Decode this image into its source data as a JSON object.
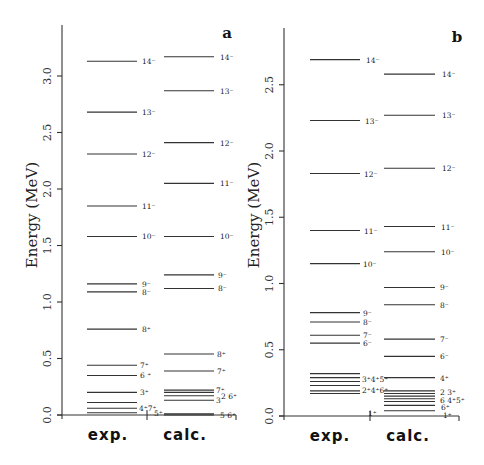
{
  "figure": {
    "panels": [
      {
        "id": "a",
        "letter": "a",
        "ylabel": "Energy (MeV)",
        "columns": [
          "exp.",
          "calc."
        ],
        "yaxis": {
          "zero_px": 415,
          "px_per_mev": 113,
          "x_px": 62,
          "top_px": 25,
          "ticks": [
            "0.0",
            "0.5",
            "1.0",
            "1.5",
            "2.0",
            "2.5",
            "3.0"
          ],
          "tick_values": [
            0.0,
            0.5,
            1.0,
            1.5,
            2.0,
            2.5,
            3.0
          ]
        },
        "baseline": {
          "x1": 57,
          "x2": 236,
          "sep_x": 147
        },
        "column_label_x": [
          108,
          185
        ],
        "exp": {
          "x1": 87,
          "x2": 137,
          "levels": [
            {
              "E": 3.13,
              "label": "14⁻",
              "lx": 142
            },
            {
              "E": 2.68,
              "label": "13⁻",
              "lx": 142
            },
            {
              "E": 2.31,
              "label": "12⁻",
              "lx": 142
            },
            {
              "E": 1.85,
              "label": "11⁻",
              "lx": 142
            },
            {
              "E": 1.58,
              "label": "10⁻",
              "lx": 142
            },
            {
              "E": 1.16,
              "label": "9⁻",
              "lx": 142
            },
            {
              "E": 1.09,
              "label": "8⁻",
              "lx": 142
            },
            {
              "E": 0.76,
              "label": "8⁺",
              "lx": 142
            },
            {
              "E": 0.44,
              "label": "7⁺",
              "lx": 140
            },
            {
              "E": 0.35,
              "label": "6 ⁺",
              "lx": 140
            },
            {
              "E": 0.2,
              "label": "3⁺",
              "lx": 140
            },
            {
              "E": 0.11,
              "label": "",
              "lx": 0
            },
            {
              "E": 0.06,
              "label": "4⁺7⁺",
              "lx": 139
            },
            {
              "E": 0.02,
              "label": "",
              "lx": 0
            }
          ],
          "extra_labels": [
            {
              "E": 0.02,
              "label": "5⁺",
              "lx": 154
            }
          ]
        },
        "calc": {
          "x1": 164,
          "x2": 214,
          "levels": [
            {
              "E": 3.17,
              "label": "14⁻",
              "lx": 220
            },
            {
              "E": 2.87,
              "label": "13⁻",
              "lx": 220
            },
            {
              "E": 2.41,
              "label": "12⁻",
              "lx": 220
            },
            {
              "E": 2.05,
              "label": "11⁻",
              "lx": 220
            },
            {
              "E": 1.58,
              "label": "10⁻",
              "lx": 220
            },
            {
              "E": 1.24,
              "label": "9⁻",
              "lx": 218
            },
            {
              "E": 1.12,
              "label": "8⁻",
              "lx": 218
            },
            {
              "E": 0.54,
              "label": "8⁺",
              "lx": 217
            },
            {
              "E": 0.39,
              "label": "7⁺",
              "lx": 217
            },
            {
              "E": 0.22,
              "label": "7⁺",
              "lx": 216
            },
            {
              "E": 0.2,
              "label": "",
              "lx": 0
            },
            {
              "E": 0.17,
              "label": "2 6⁺",
              "lx": 221
            },
            {
              "E": 0.13,
              "label": "3",
              "lx": 216
            },
            {
              "E": 0.01,
              "label": "",
              "lx": 0
            },
            {
              "E": 0.0,
              "label": "5 6⁺",
              "lx": 220
            }
          ]
        }
      },
      {
        "id": "b",
        "letter": "b",
        "ylabel": "Energy (MeV)",
        "columns": [
          "exp.",
          "calc."
        ],
        "yaxis": {
          "zero_px": 416,
          "px_per_mev": 132.5,
          "x_px": 284,
          "top_px": 28,
          "ticks": [
            "0.0",
            "0.5",
            "1.0",
            "1.5",
            "2.0",
            "2.5"
          ],
          "tick_values": [
            0.0,
            0.5,
            1.0,
            1.5,
            2.0,
            2.5
          ]
        },
        "baseline": {
          "x1": 279,
          "x2": 459,
          "sep_x": 370
        },
        "column_label_x": [
          330,
          408
        ],
        "exp": {
          "x1": 310,
          "x2": 360,
          "levels": [
            {
              "E": 2.69,
              "label": "14⁻",
              "lx": 366
            },
            {
              "E": 2.23,
              "label": "13⁻",
              "lx": 365
            },
            {
              "E": 1.83,
              "label": "12⁻",
              "lx": 364
            },
            {
              "E": 1.4,
              "label": "11⁻",
              "lx": 364
            },
            {
              "E": 1.15,
              "label": "10⁻",
              "lx": 363
            },
            {
              "E": 0.78,
              "label": "9⁻",
              "lx": 363
            },
            {
              "E": 0.71,
              "label": "8⁻",
              "lx": 363
            },
            {
              "E": 0.61,
              "label": "7⁻",
              "lx": 363
            },
            {
              "E": 0.55,
              "label": "6⁻",
              "lx": 363
            },
            {
              "E": 0.32,
              "label": "",
              "lx": 0
            },
            {
              "E": 0.29,
              "label": "",
              "lx": 0
            },
            {
              "E": 0.26,
              "label": "",
              "lx": 0
            },
            {
              "E": 0.23,
              "label": "",
              "lx": 0
            },
            {
              "E": 0.19,
              "label": "",
              "lx": 0
            },
            {
              "E": 0.17,
              "label": "",
              "lx": 0
            }
          ],
          "extra_labels": [
            {
              "E": 0.28,
              "label": "3⁺4⁺5⁺",
              "lx": 362
            },
            {
              "E": 0.2,
              "label": "2⁺4⁺6⁺",
              "lx": 362
            },
            {
              "E": 0.02,
              "label": "1⁺",
              "lx": 368
            }
          ]
        },
        "calc": {
          "x1": 384,
          "x2": 435,
          "levels": [
            {
              "E": 2.58,
              "label": "14⁻",
              "lx": 442
            },
            {
              "E": 2.27,
              "label": "13⁻",
              "lx": 442
            },
            {
              "E": 1.87,
              "label": "12⁻",
              "lx": 442
            },
            {
              "E": 1.43,
              "label": "11⁻",
              "lx": 441
            },
            {
              "E": 1.24,
              "label": "10⁻",
              "lx": 441
            },
            {
              "E": 0.97,
              "label": "9⁻",
              "lx": 440
            },
            {
              "E": 0.84,
              "label": "8⁻",
              "lx": 440
            },
            {
              "E": 0.58,
              "label": "7⁻",
              "lx": 440
            },
            {
              "E": 0.45,
              "label": "6⁻",
              "lx": 440
            },
            {
              "E": 0.29,
              "label": "4⁺",
              "lx": 440
            },
            {
              "E": 0.19,
              "label": "",
              "lx": 0
            },
            {
              "E": 0.17,
              "label": "",
              "lx": 0
            },
            {
              "E": 0.15,
              "label": "",
              "lx": 0
            },
            {
              "E": 0.13,
              "label": "",
              "lx": 0
            },
            {
              "E": 0.11,
              "label": "",
              "lx": 0
            },
            {
              "E": 0.08,
              "label": "",
              "lx": 0
            },
            {
              "E": 0.04,
              "label": "",
              "lx": 0
            }
          ],
          "extra_labels": [
            {
              "E": 0.18,
              "label": "2 3⁺",
              "lx": 440
            },
            {
              "E": 0.12,
              "label": "6 4⁺5⁺",
              "lx": 440
            },
            {
              "E": 0.07,
              "label": "6⁺",
              "lx": 441
            },
            {
              "E": 0.01,
              "label": "1⁺",
              "lx": 443
            }
          ]
        }
      }
    ]
  },
  "chart_data": [
    {
      "type": "level-scheme",
      "title": "a",
      "xlabel": "",
      "ylabel": "Energy (MeV)",
      "ylim": [
        0,
        3.3
      ],
      "yticks": [
        0.0,
        0.5,
        1.0,
        1.5,
        2.0,
        2.5,
        3.0
      ],
      "categories": [
        "exp.",
        "calc."
      ],
      "series": [
        {
          "name": "exp.",
          "levels": [
            {
              "spin": "14-",
              "E": 3.13
            },
            {
              "spin": "13-",
              "E": 2.68
            },
            {
              "spin": "12-",
              "E": 2.31
            },
            {
              "spin": "11-",
              "E": 1.85
            },
            {
              "spin": "10-",
              "E": 1.58
            },
            {
              "spin": "9-",
              "E": 1.16
            },
            {
              "spin": "8-",
              "E": 1.09
            },
            {
              "spin": "8+",
              "E": 0.76
            },
            {
              "spin": "7+",
              "E": 0.44
            },
            {
              "spin": "6+",
              "E": 0.35
            },
            {
              "spin": "3+",
              "E": 0.2
            },
            {
              "spin": "4+",
              "E": 0.11
            },
            {
              "spin": "7+",
              "E": 0.06
            },
            {
              "spin": "5+",
              "E": 0.02
            }
          ]
        },
        {
          "name": "calc.",
          "levels": [
            {
              "spin": "14-",
              "E": 3.17
            },
            {
              "spin": "13-",
              "E": 2.87
            },
            {
              "spin": "12-",
              "E": 2.41
            },
            {
              "spin": "11-",
              "E": 2.05
            },
            {
              "spin": "10-",
              "E": 1.58
            },
            {
              "spin": "9-",
              "E": 1.24
            },
            {
              "spin": "8-",
              "E": 1.12
            },
            {
              "spin": "8+",
              "E": 0.54
            },
            {
              "spin": "7+",
              "E": 0.39
            },
            {
              "spin": "7+",
              "E": 0.22
            },
            {
              "spin": "2",
              "E": 0.2
            },
            {
              "spin": "6+",
              "E": 0.17
            },
            {
              "spin": "3",
              "E": 0.13
            },
            {
              "spin": "5",
              "E": 0.01
            },
            {
              "spin": "6+",
              "E": 0.0
            }
          ]
        }
      ]
    },
    {
      "type": "level-scheme",
      "title": "b",
      "xlabel": "",
      "ylabel": "Energy (MeV)",
      "ylim": [
        0,
        2.9
      ],
      "yticks": [
        0.0,
        0.5,
        1.0,
        1.5,
        2.0,
        2.5
      ],
      "categories": [
        "exp.",
        "calc."
      ],
      "series": [
        {
          "name": "exp.",
          "levels": [
            {
              "spin": "14-",
              "E": 2.69
            },
            {
              "spin": "13-",
              "E": 2.23
            },
            {
              "spin": "12-",
              "E": 1.83
            },
            {
              "spin": "11-",
              "E": 1.4
            },
            {
              "spin": "10-",
              "E": 1.15
            },
            {
              "spin": "9-",
              "E": 0.78
            },
            {
              "spin": "8-",
              "E": 0.71
            },
            {
              "spin": "7-",
              "E": 0.61
            },
            {
              "spin": "6-",
              "E": 0.55
            },
            {
              "spin": "3+",
              "E": 0.32
            },
            {
              "spin": "4+",
              "E": 0.29
            },
            {
              "spin": "5+",
              "E": 0.26
            },
            {
              "spin": "2+",
              "E": 0.23
            },
            {
              "spin": "4+",
              "E": 0.19
            },
            {
              "spin": "6+",
              "E": 0.17
            },
            {
              "spin": "1+",
              "E": 0.0
            }
          ]
        },
        {
          "name": "calc.",
          "levels": [
            {
              "spin": "14-",
              "E": 2.58
            },
            {
              "spin": "13-",
              "E": 2.27
            },
            {
              "spin": "12-",
              "E": 1.87
            },
            {
              "spin": "11-",
              "E": 1.43
            },
            {
              "spin": "10-",
              "E": 1.24
            },
            {
              "spin": "9-",
              "E": 0.97
            },
            {
              "spin": "8-",
              "E": 0.84
            },
            {
              "spin": "7-",
              "E": 0.58
            },
            {
              "spin": "6-",
              "E": 0.45
            },
            {
              "spin": "4+",
              "E": 0.29
            },
            {
              "spin": "2",
              "E": 0.19
            },
            {
              "spin": "3+",
              "E": 0.17
            },
            {
              "spin": "6",
              "E": 0.15
            },
            {
              "spin": "4+",
              "E": 0.13
            },
            {
              "spin": "5+",
              "E": 0.11
            },
            {
              "spin": "6+",
              "E": 0.08
            },
            {
              "spin": "1+",
              "E": 0.04
            }
          ]
        }
      ]
    }
  ]
}
